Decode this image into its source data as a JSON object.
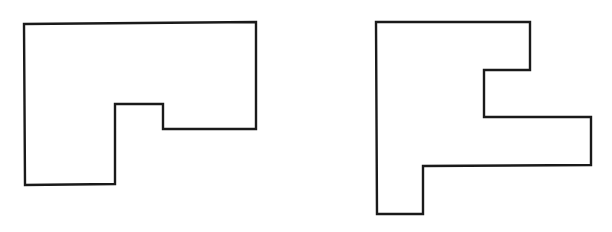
{
  "figure": {
    "width": 612,
    "height": 232,
    "background": "#ffffff",
    "stroke_color": "#1a1a1a",
    "shapes": [
      {
        "id": "shape-1",
        "description": "rectilinear polygon: wide rectangle with a downward leg on the lower-left and a small step notch",
        "points": [
          [
            24,
            24
          ],
          [
            256,
            22
          ],
          [
            256,
            129
          ],
          [
            163,
            129
          ],
          [
            163,
            104
          ],
          [
            115,
            104
          ],
          [
            115,
            184
          ],
          [
            25,
            185
          ]
        ]
      },
      {
        "id": "shape-2",
        "description": "rectilinear polygon: F-like shape with a notch on the upper right and a rightward arm in the middle",
        "points": [
          [
            376,
            22
          ],
          [
            530,
            22
          ],
          [
            530,
            70
          ],
          [
            484,
            70
          ],
          [
            484,
            117
          ],
          [
            591,
            117
          ],
          [
            591,
            165
          ],
          [
            423,
            166
          ],
          [
            423,
            214
          ],
          [
            377,
            214
          ]
        ]
      }
    ]
  }
}
